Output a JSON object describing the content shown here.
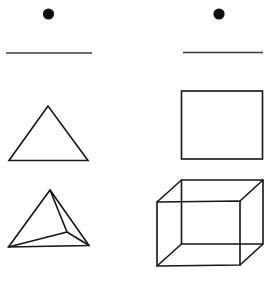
{
  "figure": {
    "title": "Geometric shapes: 2D figures and 3D solids",
    "background_color": "#ffffff",
    "stroke_color": "#151515",
    "rule_color": "#3a3a3a",
    "dot_color": "#0d0d0d",
    "width": 273,
    "height": 281,
    "columns": [
      {
        "name": "left-column",
        "label": "triangle-column",
        "marker": {
          "name": "bullet-dot",
          "cx": 48.5,
          "cy": 14,
          "r": 5.6
        },
        "rule": {
          "name": "horizontal-rule",
          "x1": 6,
          "y1": 53,
          "x2": 92,
          "y2": 53
        },
        "shapes": [
          {
            "name": "triangle",
            "kind": "2d-polygon",
            "points": "48,106 9,160.5 88,160.5"
          },
          {
            "name": "tetrahedron",
            "kind": "3d-solid",
            "outline": "50,190 8.5,247 89,245.5",
            "edges": [
              "50,190 67,232",
              "8.5,247 67,232",
              "89,245.5 67,232"
            ]
          }
        ]
      },
      {
        "name": "right-column",
        "label": "square-column",
        "marker": {
          "name": "bullet-dot",
          "cx": 219,
          "cy": 14,
          "r": 5.6
        },
        "rule": {
          "name": "horizontal-rule",
          "x1": 183,
          "y1": 52.5,
          "x2": 263,
          "y2": 52.5
        },
        "shapes": [
          {
            "name": "square",
            "kind": "2d-polygon",
            "points": "181.5,91 262.5,91 262.5,159 181.5,159"
          },
          {
            "name": "cube",
            "kind": "3d-solid",
            "front_face": "157,202 240,201 240,265 157,266",
            "back_face": "181.5,180 263,180 263,244 181.5,244",
            "connectors": [
              "157,202 181.5,180",
              "240,201 263,180",
              "240,265 263,244",
              "157,266 181.5,244"
            ]
          }
        ]
      }
    ]
  }
}
